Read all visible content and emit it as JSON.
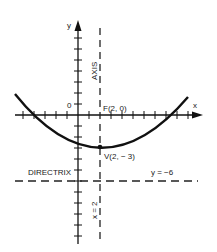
{
  "diagram": {
    "type": "parabola",
    "equation_note": "vertical parabola opening upward",
    "axes": {
      "x_label": "x",
      "y_label": "y",
      "origin_label": "0"
    },
    "focus": {
      "label": "F(2, 0)",
      "x": 2,
      "y": 0
    },
    "vertex": {
      "label": "V(2, − 3)",
      "x": 2,
      "y": -3
    },
    "axis_of_symmetry": {
      "label": "AXIS",
      "equation_label": "x = 2"
    },
    "directrix": {
      "label": "DIRECTRIX",
      "equation_label": "y = −6"
    }
  }
}
